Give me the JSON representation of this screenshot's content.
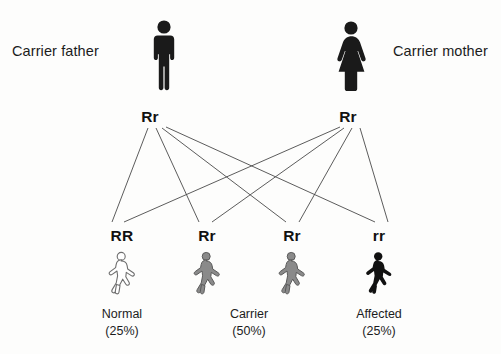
{
  "diagram": {
    "background_color": "#fdfdfc",
    "line_color": "#4a4a4a"
  },
  "parents": [
    {
      "id": "father",
      "label": "Carrier father",
      "genotype": "Rr",
      "icon": "male-figure-icon",
      "fill": "#1a1a1a",
      "label_x": 12,
      "label_y": 43,
      "figure_x": 148,
      "figure_y": 20,
      "genotype_x": 150,
      "genotype_y": 108
    },
    {
      "id": "mother",
      "label": "Carrier mother",
      "genotype": "Rr",
      "icon": "female-figure-icon",
      "fill": "#1a1a1a",
      "label_x": 393,
      "label_y": 43,
      "figure_x": 331,
      "figure_y": 21,
      "genotype_x": 348,
      "genotype_y": 108
    }
  ],
  "offspring": [
    {
      "id": "child-1",
      "genotype": "RR",
      "icon": "child-figure-outline-icon",
      "fill": "#ffffff",
      "stroke": "#6e6e6e",
      "center_x": 122,
      "genotype_y": 227,
      "figure_y": 252
    },
    {
      "id": "child-2",
      "genotype": "Rr",
      "icon": "child-figure-gray-icon",
      "fill": "#8a8a8a",
      "stroke": "#5a5a5a",
      "center_x": 207,
      "genotype_y": 227,
      "figure_y": 252
    },
    {
      "id": "child-3",
      "genotype": "Rr",
      "icon": "child-figure-gray-icon",
      "fill": "#8a8a8a",
      "stroke": "#5a5a5a",
      "center_x": 292,
      "genotype_y": 227,
      "figure_y": 252
    },
    {
      "id": "child-4",
      "genotype": "rr",
      "icon": "child-figure-black-icon",
      "fill": "#111111",
      "stroke": "#111111",
      "center_x": 379,
      "genotype_y": 227,
      "figure_y": 252
    }
  ],
  "outcomes": [
    {
      "id": "outcome-normal",
      "name": "Normal",
      "percent": "(25%)",
      "center_x": 122,
      "y": 306
    },
    {
      "id": "outcome-carrier",
      "name": "Carrier",
      "percent": "(50%)",
      "center_x": 249,
      "y": 306
    },
    {
      "id": "outcome-affected",
      "name": "Affected",
      "percent": "(25%)",
      "center_x": 379,
      "y": 306
    }
  ],
  "connections": [
    {
      "from": "father",
      "to": "child-1",
      "x1": 148,
      "y1": 128,
      "x2": 112,
      "y2": 222
    },
    {
      "from": "father",
      "to": "child-2",
      "x1": 156,
      "y1": 128,
      "x2": 199,
      "y2": 222
    },
    {
      "from": "father",
      "to": "child-3",
      "x1": 162,
      "y1": 128,
      "x2": 286,
      "y2": 222
    },
    {
      "from": "father",
      "to": "child-4",
      "x1": 166,
      "y1": 127,
      "x2": 375,
      "y2": 222
    },
    {
      "from": "mother",
      "to": "child-1",
      "x1": 340,
      "y1": 127,
      "x2": 124,
      "y2": 222
    },
    {
      "from": "mother",
      "to": "child-2",
      "x1": 344,
      "y1": 128,
      "x2": 212,
      "y2": 222
    },
    {
      "from": "mother",
      "to": "child-3",
      "x1": 352,
      "y1": 128,
      "x2": 299,
      "y2": 222
    },
    {
      "from": "mother",
      "to": "child-4",
      "x1": 360,
      "y1": 128,
      "x2": 388,
      "y2": 222
    }
  ]
}
